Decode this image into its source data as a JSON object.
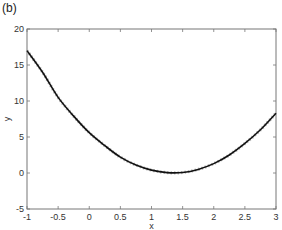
{
  "panel_label": "(b)",
  "chart_data": {
    "type": "line",
    "title": "",
    "xlabel": "x",
    "ylabel": "y",
    "xlim": [
      -1,
      3
    ],
    "ylim": [
      -5,
      20
    ],
    "grid": false,
    "legend": null,
    "x_ticks": [
      -1,
      -0.5,
      0,
      0.5,
      1,
      1.5,
      2,
      2.5,
      3
    ],
    "x_tick_labels": [
      "-1",
      "-0.5",
      "0",
      "0.5",
      "1",
      "1.5",
      "2",
      "2.5",
      "3"
    ],
    "y_ticks": [
      -5,
      0,
      5,
      10,
      15,
      20
    ],
    "y_tick_labels": [
      "-5",
      "0",
      "5",
      "10",
      "15",
      "20"
    ],
    "series": [
      {
        "name": "fit",
        "style": "solid black line with overlaid light gray markers",
        "x": [
          -1,
          -0.75,
          -0.5,
          -0.25,
          0,
          0.25,
          0.5,
          0.75,
          1,
          1.25,
          1.5,
          1.75,
          2,
          2.25,
          2.5,
          2.75,
          3
        ],
        "y": [
          17.0,
          14.0,
          10.5,
          7.9,
          5.6,
          3.8,
          2.2,
          1.1,
          0.4,
          0.05,
          0.07,
          0.5,
          1.3,
          2.5,
          4.1,
          6.0,
          8.3
        ]
      }
    ]
  },
  "colors": {
    "line": "#111111",
    "markers": "#bbbbbb",
    "axes": "#777777"
  }
}
